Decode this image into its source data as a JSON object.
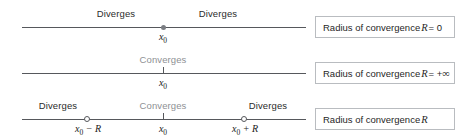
{
  "figure": {
    "colors": {
      "axis": "#56585c",
      "diverges_text": "#2b2b2b",
      "converges_text": "#8e9094",
      "box_border": "#b9bcc0",
      "background": "#ffffff"
    }
  },
  "rows": [
    {
      "id": "case-r-zero",
      "regions": [
        {
          "label": "Diverges",
          "tone": "dark",
          "x": 116
        },
        {
          "label": "Diverges",
          "tone": "dark",
          "x": 218
        }
      ],
      "points": [
        {
          "label_text": "x",
          "label_sub": "0",
          "marker": "dot",
          "x": 163
        }
      ],
      "caption": {
        "text_before": "Radius of convergence",
        "variable": "R",
        "text_after": "= 0",
        "infinity": ""
      }
    },
    {
      "id": "case-r-infinite",
      "regions": [
        {
          "label": "Converges",
          "tone": "muted",
          "x": 163
        }
      ],
      "points": [
        {
          "label_text": "x",
          "label_sub": "0",
          "marker": "tick",
          "x": 163
        }
      ],
      "caption": {
        "text_before": "Radius of convergence",
        "variable": "R",
        "text_after": "= +",
        "infinity": "∞"
      }
    },
    {
      "id": "case-r-finite",
      "regions": [
        {
          "label": "Diverges",
          "tone": "dark",
          "x": 58
        },
        {
          "label": "Converges",
          "tone": "muted",
          "x": 163
        },
        {
          "label": "Diverges",
          "tone": "dark",
          "x": 268
        }
      ],
      "points": [
        {
          "label_text": "x",
          "label_sub": "0",
          "label_suffix": " − R",
          "marker": "open",
          "x": 88
        },
        {
          "label_text": "x",
          "label_sub": "0",
          "marker": "tick",
          "x": 163
        },
        {
          "label_text": "x",
          "label_sub": "0",
          "label_suffix": " + R",
          "marker": "open",
          "x": 245
        }
      ],
      "caption": {
        "text_before": "Radius of convergence",
        "variable": "R",
        "text_after": "",
        "infinity": ""
      }
    }
  ]
}
